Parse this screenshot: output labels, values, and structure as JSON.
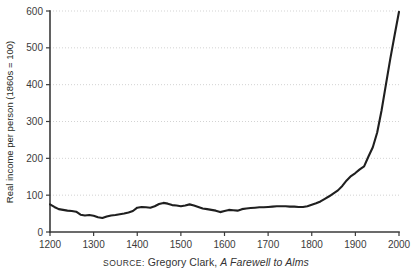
{
  "caption": {
    "source_label": "SOURCE:",
    "author": " Gregory Clark, ",
    "work_title": "A Farewell to Alms"
  },
  "chart_data": {
    "type": "line",
    "title": "",
    "xlabel": "",
    "ylabel": "Real income per person (1860s = 100)",
    "xlim": [
      1200,
      2000
    ],
    "ylim": [
      0,
      600
    ],
    "grid": true,
    "legend": null,
    "xticks": [
      1200,
      1300,
      1400,
      1500,
      1600,
      1700,
      1800,
      1900,
      2000
    ],
    "yticks": [
      0,
      100,
      200,
      300,
      400,
      500,
      600
    ],
    "series": [
      {
        "name": "Real income per person (England, 1860s = 100)",
        "x": [
          1200,
          1210,
          1220,
          1230,
          1240,
          1250,
          1260,
          1270,
          1280,
          1290,
          1300,
          1310,
          1320,
          1330,
          1340,
          1350,
          1360,
          1370,
          1380,
          1390,
          1400,
          1410,
          1420,
          1430,
          1440,
          1450,
          1460,
          1470,
          1480,
          1490,
          1500,
          1510,
          1520,
          1530,
          1540,
          1550,
          1560,
          1570,
          1580,
          1590,
          1600,
          1610,
          1620,
          1630,
          1640,
          1650,
          1660,
          1670,
          1680,
          1690,
          1700,
          1710,
          1720,
          1730,
          1740,
          1750,
          1760,
          1770,
          1780,
          1790,
          1800,
          1810,
          1820,
          1830,
          1840,
          1850,
          1860,
          1870,
          1880,
          1890,
          1900,
          1910,
          1920,
          1930,
          1940,
          1950,
          1960,
          1970,
          1980,
          1990,
          2000
        ],
        "values": [
          75,
          68,
          62,
          60,
          58,
          57,
          55,
          47,
          45,
          46,
          44,
          40,
          38,
          42,
          45,
          46,
          48,
          50,
          53,
          57,
          66,
          68,
          67,
          66,
          70,
          76,
          79,
          77,
          73,
          72,
          70,
          72,
          75,
          72,
          68,
          64,
          62,
          60,
          58,
          54,
          57,
          60,
          59,
          58,
          62,
          64,
          65,
          66,
          67,
          67,
          68,
          69,
          70,
          70,
          70,
          69,
          69,
          68,
          68,
          70,
          74,
          78,
          83,
          90,
          97,
          105,
          113,
          125,
          140,
          152,
          160,
          170,
          178,
          205,
          230,
          270,
          330,
          400,
          470,
          535,
          598
        ]
      }
    ]
  }
}
